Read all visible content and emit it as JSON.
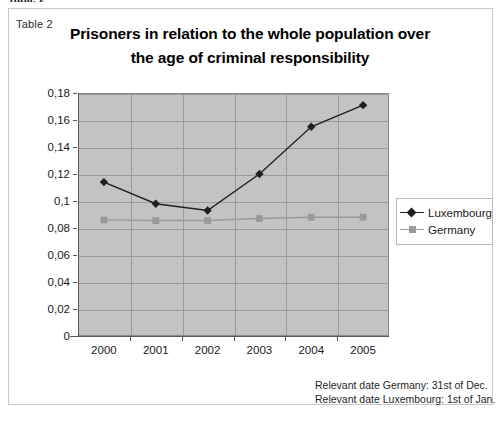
{
  "clipped_caption": "Table 2",
  "table_caption": "Table 2",
  "title_line1": "Prisoners in relation to the whole population over",
  "title_line2": "the age of criminal responsibility",
  "footnotes": [
    "Relevant  date Germany: 31st of Dec.",
    "Relevant date Luxembourg: 1st of Jan."
  ],
  "legend": {
    "items": [
      {
        "label": "Luxembourg",
        "marker": "diamond-marker",
        "color": "#202020"
      },
      {
        "label": "Germany",
        "marker": "square-marker",
        "color": "#9a9a9a"
      }
    ]
  },
  "colors": {
    "plot_background": "#c3c3c3",
    "gridline": "#9b9b9b",
    "luxembourg": "#202020",
    "germany": "#9a9a9a",
    "axis": "#5a5a5a"
  },
  "chart_data": {
    "type": "line",
    "title": "Prisoners in relation to the whole population over the age of criminal responsibility",
    "subtitle": "",
    "xlabel": "",
    "ylabel": "",
    "categories": [
      "2000",
      "2001",
      "2002",
      "2003",
      "2004",
      "2005"
    ],
    "ytick_labels": [
      "0",
      "0,02",
      "0,04",
      "0,06",
      "0,08",
      "0,1",
      "0,12",
      "0,14",
      "0,16",
      "0,18"
    ],
    "ytick_values": [
      0,
      0.02,
      0.04,
      0.06,
      0.08,
      0.1,
      0.12,
      0.14,
      0.16,
      0.18
    ],
    "ylim": [
      0,
      0.18
    ],
    "grid": true,
    "legend_position": "right",
    "series": [
      {
        "name": "Luxembourg",
        "values": [
          0.114,
          0.098,
          0.093,
          0.12,
          0.155,
          0.171
        ]
      },
      {
        "name": "Germany",
        "values": [
          0.086,
          0.0855,
          0.0855,
          0.087,
          0.088,
          0.088
        ]
      }
    ]
  }
}
